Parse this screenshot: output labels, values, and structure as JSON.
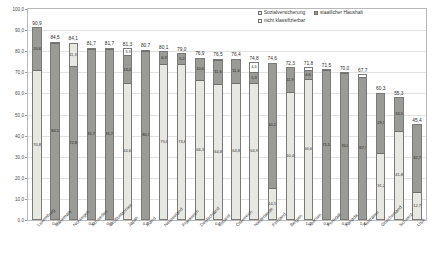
{
  "chart_data": {
    "type": "bar",
    "subtype": "stacked-vertical",
    "title": "",
    "xlabel": "",
    "ylabel": "",
    "ylim": [
      0.0,
      100.0
    ],
    "ytick_labels": [
      "100,0",
      "90,0",
      "80,0",
      "70,0",
      "60,0",
      "50,0",
      "40,0",
      "30,0",
      "20,0",
      "10,0",
      "0,0"
    ],
    "ytick_values": [
      100.0,
      90.0,
      80.0,
      70.0,
      60.0,
      50.0,
      40.0,
      30.0,
      20.0,
      10.0,
      0.0
    ],
    "grid": true,
    "legend_position": "top-right",
    "legend": [
      "Sozialversicherung",
      "staatlicher Haushalt",
      "nicht klassifizierbar"
    ],
    "categories": [
      "Luxemburg",
      "Dänemark",
      "Norwegen",
      "Schweden",
      "Großbritannien",
      "Japan",
      "Irland",
      "Neuseeland",
      "Frankreich",
      "Deutschland",
      "Estland",
      "Österreich",
      "Niederlande",
      "Finnland",
      "Belgien",
      "Spanien",
      "Portugal",
      "Kanada",
      "Australien",
      "Griechenland",
      "Schweiz",
      "USA"
    ],
    "series": [
      {
        "name": "Sozialversicherung",
        "key": "sv",
        "values": [
          70.8,
          0.0,
          0.0,
          0.0,
          0.0,
          64.6,
          0.0,
          73.8,
          0.0,
          66.3,
          64.8,
          0.0,
          64.9,
          60.5,
          60.4,
          66.6,
          0.0,
          0.0,
          0.0,
          31.2,
          43.8,
          16.7
        ]
      },
      {
        "name": "staatlicher Haushalt",
        "key": "sh",
        "values": [
          20.6,
          84.5,
          72.8,
          81.7,
          81.7,
          13.4,
          80.1,
          5.2,
          76.5,
          10.6,
          11.6,
          76.4,
          5.3,
          60.1,
          11.9,
          4.6,
          71.5,
          70.0,
          67.7,
          28.1,
          16.5,
          27.7
        ]
      },
      {
        "name": "nicht klassifizierbar",
        "key": "nk",
        "values": [
          0.0,
          0.0,
          0.0,
          0.0,
          0.0,
          3.3,
          0.6,
          0.0,
          0.0,
          0.0,
          0.0,
          0.0,
          4.6,
          0.0,
          0.0,
          1.1,
          0.0,
          0.0,
          0.0,
          1.0,
          0.0,
          1.0
        ]
      }
    ],
    "totals": [
      90.9,
      84.5,
      84.1,
      81.7,
      81.7,
      81.3,
      80.7,
      80.1,
      79.0,
      76.9,
      76.5,
      76.4,
      74.8,
      74.6,
      72.3,
      71.8,
      71.5,
      70.0,
      67.7,
      60.3,
      55.3,
      45.4
    ],
    "total_labels": [
      "90,9",
      "84,5",
      "84,1",
      "81,7",
      "81,7",
      "81,3",
      "80,7",
      "80,1",
      "79,0",
      "76,9",
      "76,5",
      "76,4",
      "74,8",
      "74,6",
      "72,3",
      "71,8",
      "71,5",
      "70,0",
      "67,7",
      "60,3",
      "55,3",
      "45,4"
    ],
    "bars": [
      {
        "category": "Luxemburg",
        "total_label": "90,9",
        "segments": [
          {
            "key": "sv",
            "value": 70.8,
            "label": "70,8"
          },
          {
            "key": "sh",
            "value": 20.6,
            "label": "20,6"
          }
        ]
      },
      {
        "category": "Dänemark",
        "total_label": "84,5",
        "segments": [
          {
            "key": "sh",
            "value": 84.5,
            "label": "84,5"
          },
          {
            "key": "nk",
            "value": 0.0,
            "label": "0,0"
          }
        ]
      },
      {
        "category": "Norwegen",
        "total_label": "84,1",
        "segments": [
          {
            "key": "sh",
            "value": 72.8,
            "label": "72,8"
          },
          {
            "key": "sv",
            "value": 11.3,
            "label": "11,3"
          }
        ]
      },
      {
        "category": "Schweden",
        "total_label": "81,7",
        "segments": [
          {
            "key": "sh",
            "value": 81.7,
            "label": "81,7"
          },
          {
            "key": "nk",
            "value": 0.0,
            "label": "0,0"
          }
        ]
      },
      {
        "category": "Großbritannien",
        "total_label": "81,7",
        "segments": [
          {
            "key": "sh",
            "value": 81.7,
            "label": "81,7"
          },
          {
            "key": "nk",
            "value": 0.0,
            "label": "0,0"
          }
        ]
      },
      {
        "category": "Japan",
        "total_label": "81,3",
        "segments": [
          {
            "key": "sv",
            "value": 64.6,
            "label": "64,6"
          },
          {
            "key": "sh",
            "value": 13.4,
            "label": "13,4"
          },
          {
            "key": "nk",
            "value": 3.3,
            "label": "3,3"
          }
        ]
      },
      {
        "category": "Irland",
        "total_label": "80,7",
        "segments": [
          {
            "key": "sh",
            "value": 80.1,
            "label": "80,1"
          },
          {
            "key": "nk",
            "value": 0.6,
            "label": "0,6"
          }
        ]
      },
      {
        "category": "Neuseeland",
        "total_label": "80,1",
        "segments": [
          {
            "key": "sv",
            "value": 73.8,
            "label": "73,8"
          },
          {
            "key": "sh",
            "value": 6.3,
            "label": "6,3"
          }
        ]
      },
      {
        "category": "Frankreich",
        "total_label": "79,0",
        "segments": [
          {
            "key": "sv",
            "value": 73.8,
            "label": "73,8"
          },
          {
            "key": "sh",
            "value": 5.2,
            "label": "5,2"
          }
        ]
      },
      {
        "category": "Deutschland",
        "total_label": "76,9",
        "segments": [
          {
            "key": "sv",
            "value": 66.3,
            "label": "66,3"
          },
          {
            "key": "sh",
            "value": 10.6,
            "label": "10,6"
          }
        ]
      },
      {
        "category": "Estland",
        "total_label": "76,5",
        "segments": [
          {
            "key": "sv",
            "value": 64.8,
            "label": "64,8"
          },
          {
            "key": "sh",
            "value": 11.6,
            "label": "11,6"
          },
          {
            "key": "nk",
            "value": 0.1,
            "label": "0,1"
          }
        ]
      },
      {
        "category": "Österreich",
        "total_label": "76,4",
        "segments": [
          {
            "key": "sv",
            "value": 64.8,
            "label": "64,8"
          },
          {
            "key": "sh",
            "value": 11.6,
            "label": "11,6"
          }
        ]
      },
      {
        "category": "Niederlande",
        "total_label": "74,8",
        "segments": [
          {
            "key": "sv",
            "value": 64.9,
            "label": "64,9"
          },
          {
            "key": "sh",
            "value": 5.3,
            "label": "5,3"
          },
          {
            "key": "nk",
            "value": 4.6,
            "label": "4,6"
          }
        ]
      },
      {
        "category": "Finnland",
        "total_label": "74,6",
        "segments": [
          {
            "key": "sv",
            "value": 14.5,
            "label": "14,5"
          },
          {
            "key": "sh",
            "value": 60.1,
            "label": "60,1"
          }
        ]
      },
      {
        "category": "Belgien",
        "total_label": "72,3",
        "segments": [
          {
            "key": "sv",
            "value": 60.4,
            "label": "60,4"
          },
          {
            "key": "sh",
            "value": 11.9,
            "label": "11,9"
          }
        ]
      },
      {
        "category": "Spanien",
        "total_label": "71,8",
        "segments": [
          {
            "key": "sv",
            "value": 66.6,
            "label": "66,6"
          },
          {
            "key": "sh",
            "value": 4.6,
            "label": "4,6"
          },
          {
            "key": "nk",
            "value": 1.1,
            "label": "1,1"
          }
        ]
      },
      {
        "category": "Portugal",
        "total_label": "71,5",
        "segments": [
          {
            "key": "sh",
            "value": 71.5,
            "label": "71,5"
          },
          {
            "key": "nk",
            "value": 0.0,
            "label": "0,0"
          }
        ]
      },
      {
        "category": "Kanada",
        "total_label": "70,0",
        "segments": [
          {
            "key": "sh",
            "value": 70.0,
            "label": "70,0"
          },
          {
            "key": "nk",
            "value": 0.0,
            "label": "0,0"
          }
        ]
      },
      {
        "category": "Australien",
        "total_label": "67,7",
        "segments": [
          {
            "key": "sh",
            "value": 67.7,
            "label": "67,7"
          },
          {
            "key": "nk",
            "value": 1.4,
            "label": "1,4"
          }
        ]
      },
      {
        "category": "Griechenland",
        "total_label": "60,3",
        "segments": [
          {
            "key": "sv",
            "value": 31.2,
            "label": "31,2"
          },
          {
            "key": "sh",
            "value": 29.1,
            "label": "29,1"
          }
        ]
      },
      {
        "category": "Schweiz",
        "total_label": "55,3",
        "segments": [
          {
            "key": "sv",
            "value": 41.8,
            "label": "41,8"
          },
          {
            "key": "sh",
            "value": 16.5,
            "label": "16,5"
          }
        ]
      },
      {
        "category": "USA",
        "total_label": "45,4",
        "segments": [
          {
            "key": "sv",
            "value": 12.7,
            "label": "12,7"
          },
          {
            "key": "sh",
            "value": 32.7,
            "label": "32,7"
          }
        ]
      }
    ],
    "colors": {
      "sozialversicherung": "#e8e8e3",
      "staatlicher_haushalt": "#9a9a96",
      "nicht_klassifizierbar": "#ffffff",
      "border": "#7a7a7a",
      "grid": "#e2e2e2",
      "axis": "#b9b9b9",
      "text": "#3a3a3a"
    }
  }
}
